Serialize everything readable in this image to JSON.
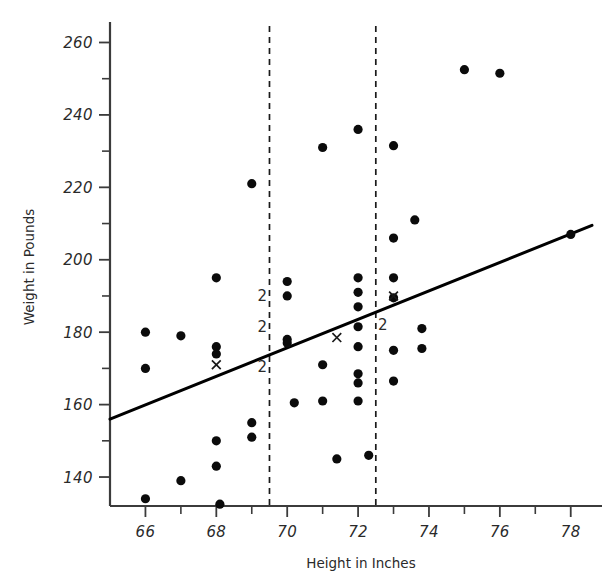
{
  "chart_data": {
    "type": "scatter",
    "title": "",
    "xlabel": "Height in Inches",
    "ylabel": "Weight in Pounds",
    "xlim": [
      65.0,
      78.6
    ],
    "ylim": [
      132.0,
      264.0
    ],
    "grid": false,
    "legend": null,
    "x_ticks_major": [
      66,
      68,
      70,
      72,
      74,
      76,
      78
    ],
    "x_tick_labels": [
      "66",
      "68",
      "70",
      "72",
      "74",
      "76",
      "78"
    ],
    "x_ticks_minor": [
      65,
      67,
      69,
      71,
      73,
      75,
      77
    ],
    "y_ticks_major": [
      140,
      160,
      180,
      200,
      220,
      240,
      260
    ],
    "y_tick_labels": [
      "140",
      "160",
      "180",
      "200",
      "220",
      "240",
      "260"
    ],
    "y_ticks_minor": [
      150,
      170,
      190,
      210,
      230,
      250
    ],
    "points": [
      {
        "x": 66.0,
        "y": 180.0
      },
      {
        "x": 66.0,
        "y": 170.0
      },
      {
        "x": 66.0,
        "y": 134.0
      },
      {
        "x": 67.0,
        "y": 179.0
      },
      {
        "x": 67.0,
        "y": 139.0
      },
      {
        "x": 68.0,
        "y": 195.0
      },
      {
        "x": 68.0,
        "y": 176.0
      },
      {
        "x": 68.0,
        "y": 174.0
      },
      {
        "x": 68.0,
        "y": 150.0
      },
      {
        "x": 68.0,
        "y": 143.0
      },
      {
        "x": 68.1,
        "y": 132.5
      },
      {
        "x": 69.0,
        "y": 221.0
      },
      {
        "x": 69.0,
        "y": 155.0
      },
      {
        "x": 69.0,
        "y": 151.0
      },
      {
        "x": 70.0,
        "y": 194.0
      },
      {
        "x": 70.0,
        "y": 190.0
      },
      {
        "x": 70.0,
        "y": 178.0
      },
      {
        "x": 70.0,
        "y": 177.0
      },
      {
        "x": 70.2,
        "y": 160.5
      },
      {
        "x": 71.0,
        "y": 231.0
      },
      {
        "x": 71.0,
        "y": 171.0
      },
      {
        "x": 71.0,
        "y": 161.0
      },
      {
        "x": 71.4,
        "y": 145.0
      },
      {
        "x": 72.0,
        "y": 236.0
      },
      {
        "x": 72.0,
        "y": 195.0
      },
      {
        "x": 72.0,
        "y": 191.0
      },
      {
        "x": 72.0,
        "y": 187.0
      },
      {
        "x": 72.0,
        "y": 181.5
      },
      {
        "x": 72.0,
        "y": 176.0
      },
      {
        "x": 72.0,
        "y": 168.5
      },
      {
        "x": 72.0,
        "y": 166.0
      },
      {
        "x": 72.0,
        "y": 161.0
      },
      {
        "x": 72.3,
        "y": 146.0
      },
      {
        "x": 73.0,
        "y": 231.5
      },
      {
        "x": 73.0,
        "y": 206.0
      },
      {
        "x": 73.0,
        "y": 195.0
      },
      {
        "x": 73.0,
        "y": 189.5
      },
      {
        "x": 73.0,
        "y": 175.0
      },
      {
        "x": 73.0,
        "y": 166.5
      },
      {
        "x": 73.6,
        "y": 211.0
      },
      {
        "x": 73.8,
        "y": 181.0
      },
      {
        "x": 73.8,
        "y": 175.5
      },
      {
        "x": 75.0,
        "y": 252.5
      },
      {
        "x": 76.0,
        "y": 251.5
      },
      {
        "x": 78.0,
        "y": 207.0
      }
    ],
    "overlap_labels": [
      {
        "x": 69.3,
        "y": 190.0,
        "text": "2"
      },
      {
        "x": 69.3,
        "y": 181.5,
        "text": "2"
      },
      {
        "x": 69.3,
        "y": 170.5,
        "text": "2"
      },
      {
        "x": 72.7,
        "y": 182.0,
        "text": "2"
      }
    ],
    "x_markers": [
      {
        "x": 68.0,
        "y": 171.0
      },
      {
        "x": 71.4,
        "y": 178.5
      },
      {
        "x": 73.0,
        "y": 190.0
      }
    ],
    "regression_line": {
      "label": "least-squares fit",
      "x_start": 65.0,
      "y_start": 156.0,
      "x_end": 78.6,
      "y_end": 209.5
    },
    "reference_lines": [
      {
        "orientation": "vertical",
        "x": 69.5,
        "style": "dashed"
      },
      {
        "orientation": "vertical",
        "x": 72.5,
        "style": "dashed"
      }
    ]
  }
}
